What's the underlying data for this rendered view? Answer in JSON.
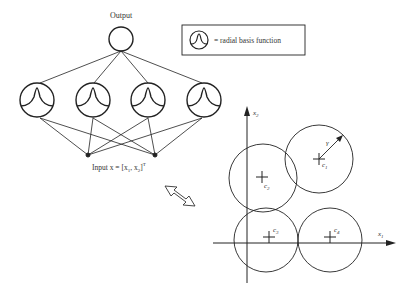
{
  "network": {
    "output_label": "Output",
    "input_label": "Input  x = [x",
    "input_sub1": "1",
    "input_mid": ",  x",
    "input_sub2": "2",
    "input_end": "]",
    "input_sup": "T",
    "hidden_unit_count": 4,
    "input_node_count": 2
  },
  "legend": {
    "text": "= radial basis function",
    "icon": "radial-basis-function-icon"
  },
  "plot": {
    "x_axis_label": "x",
    "x_axis_sub": "1",
    "y_axis_label": "x",
    "y_axis_sub": "2",
    "radius_label": "γ",
    "centers": [
      {
        "label": "c",
        "sub": "1"
      },
      {
        "label": "c",
        "sub": "2"
      },
      {
        "label": "c",
        "sub": "3"
      },
      {
        "label": "c",
        "sub": "4"
      }
    ]
  },
  "connector": {
    "icon": "double-arrow-icon"
  },
  "colors": {
    "stroke": "#222222",
    "background": "#ffffff"
  }
}
